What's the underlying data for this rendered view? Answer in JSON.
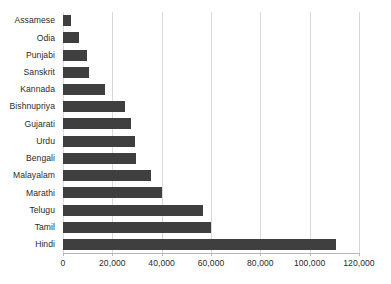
{
  "chart_data": {
    "type": "bar",
    "orientation": "horizontal",
    "title": "",
    "subtitle": "",
    "xlabel": "",
    "ylabel": "",
    "categories": [
      "Assamese",
      "Odia",
      "Punjabi",
      "Sanskrit",
      "Kannada",
      "Bishnupriya",
      "Gujarati",
      "Urdu",
      "Bengali",
      "Malayalam",
      "Marathi",
      "Telugu",
      "Tamil",
      "Hindi"
    ],
    "values": [
      3200,
      6500,
      9700,
      10500,
      17000,
      25000,
      27500,
      29000,
      29500,
      35500,
      40000,
      56700,
      60000,
      110500
    ],
    "xlim": [
      0,
      120000
    ],
    "xticks": [
      0,
      20000,
      40000,
      60000,
      80000,
      100000,
      120000
    ],
    "xtick_labels": [
      "0",
      "20,000",
      "40,000",
      "60,000",
      "80,000",
      "100,000",
      "120,000"
    ],
    "grid": "vertical",
    "legend": "none",
    "bar_color": "#3f3f3f",
    "gridline_color": "#d9d9d9",
    "axis_color": "#b7b7b7",
    "text_color": "#2b2b2b",
    "background_color": "#ffffff"
  }
}
